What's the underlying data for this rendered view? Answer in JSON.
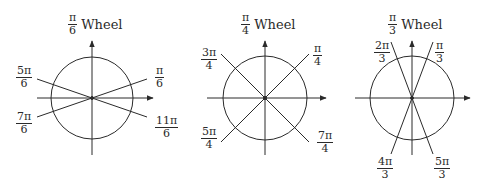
{
  "wheels": [
    {
      "title": {
        "num": "π",
        "den": "6",
        "word": "Wheel"
      },
      "center": [
        92,
        98
      ],
      "radius": 41,
      "labels": [
        {
          "num": "π",
          "den": "6"
        },
        {
          "num": "5π",
          "den": "6"
        },
        {
          "num": "7π",
          "den": "6"
        },
        {
          "num": "11π",
          "den": "6"
        }
      ]
    },
    {
      "title": {
        "num": "π",
        "den": "4",
        "word": "Wheel"
      },
      "center": [
        265,
        98
      ],
      "radius": 42,
      "labels": [
        {
          "num": "π",
          "den": "4"
        },
        {
          "num": "3π",
          "den": "4"
        },
        {
          "num": "5π",
          "den": "4"
        },
        {
          "num": "7π",
          "den": "4"
        }
      ]
    },
    {
      "title": {
        "num": "π",
        "den": "3",
        "word": "Wheel"
      },
      "center": [
        412,
        98
      ],
      "radius": 42,
      "labels": [
        {
          "num": "π",
          "den": "3"
        },
        {
          "num": "2π",
          "den": "3"
        },
        {
          "num": "4π",
          "den": "3"
        },
        {
          "num": "5π",
          "den": "3"
        }
      ]
    }
  ],
  "colors": {
    "stroke": "#2a2a2a",
    "background": "#ffffff"
  }
}
